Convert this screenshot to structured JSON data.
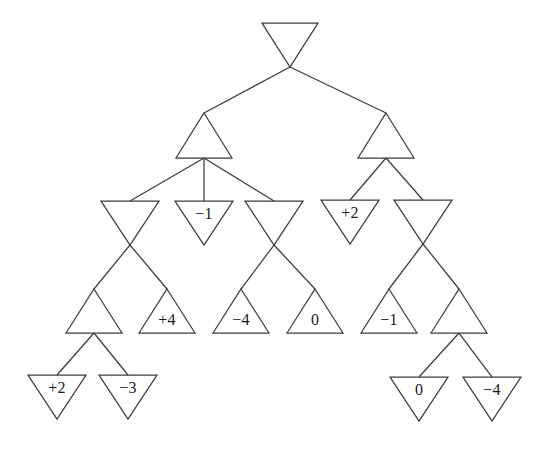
{
  "figure": {
    "kind": "game-tree-diagram",
    "title": "",
    "background_color": "#ffffff",
    "stroke_color": "#3c3c3c",
    "label_color": "#1a1a1a"
  },
  "chart_data": {
    "type": "diagram",
    "title": "",
    "xlabel": "",
    "ylabel": "",
    "node_shapes": {
      "min": "downward-triangle",
      "max": "upward-triangle"
    },
    "levels": [
      {
        "depth": 0,
        "player": "min",
        "shape": "downward-triangle",
        "nodes": [
          {
            "id": "n0",
            "label": "",
            "cx": 290,
            "top_y": 23,
            "apex_y": 67,
            "half_width": 28
          }
        ]
      },
      {
        "depth": 1,
        "player": "max",
        "shape": "upward-triangle",
        "nodes": [
          {
            "id": "n1",
            "label": "",
            "cx": 204,
            "apex_y": 113,
            "base_y": 158,
            "half_width": 28
          },
          {
            "id": "n2",
            "label": "",
            "cx": 386,
            "apex_y": 113,
            "base_y": 158,
            "half_width": 28
          }
        ]
      },
      {
        "depth": 2,
        "player": "min",
        "shape": "downward-triangle",
        "nodes": [
          {
            "id": "n3",
            "label": "",
            "cx": 130,
            "top_y": 201,
            "apex_y": 245,
            "half_width": 29
          },
          {
            "id": "n4",
            "label": "−1",
            "cx": 204,
            "top_y": 201,
            "apex_y": 245,
            "half_width": 29
          },
          {
            "id": "n5",
            "label": "",
            "cx": 274,
            "top_y": 201,
            "apex_y": 245,
            "half_width": 29
          },
          {
            "id": "n6",
            "label": "+2",
            "cx": 350,
            "top_y": 200,
            "apex_y": 244,
            "half_width": 29
          },
          {
            "id": "n7",
            "label": "",
            "cx": 423,
            "top_y": 200,
            "apex_y": 244,
            "half_width": 29
          }
        ]
      },
      {
        "depth": 3,
        "player": "max",
        "shape": "upward-triangle",
        "nodes": [
          {
            "id": "n8",
            "label": "",
            "cx": 94,
            "apex_y": 289,
            "base_y": 333,
            "half_width": 28
          },
          {
            "id": "n9",
            "label": "+4",
            "cx": 167,
            "apex_y": 289,
            "base_y": 333,
            "half_width": 28
          },
          {
            "id": "n10",
            "label": "−4",
            "cx": 241,
            "apex_y": 289,
            "base_y": 333,
            "half_width": 28
          },
          {
            "id": "n11",
            "label": "0",
            "cx": 315,
            "apex_y": 289,
            "base_y": 333,
            "half_width": 28
          },
          {
            "id": "n12",
            "label": "−1",
            "cx": 389,
            "apex_y": 289,
            "base_y": 333,
            "half_width": 28
          },
          {
            "id": "n13",
            "label": "",
            "cx": 459,
            "apex_y": 289,
            "base_y": 333,
            "half_width": 28
          }
        ]
      },
      {
        "depth": 4,
        "player": "min",
        "shape": "downward-triangle",
        "nodes": [
          {
            "id": "n14",
            "label": "+2",
            "cx": 57,
            "top_y": 375,
            "apex_y": 419,
            "half_width": 29
          },
          {
            "id": "n15",
            "label": "−3",
            "cx": 128,
            "top_y": 375,
            "apex_y": 419,
            "half_width": 29
          },
          {
            "id": "n16",
            "label": "0",
            "cx": 419,
            "top_y": 377,
            "apex_y": 421,
            "half_width": 29
          },
          {
            "id": "n17",
            "label": "−4",
            "cx": 492,
            "top_y": 377,
            "apex_y": 421,
            "half_width": 29
          }
        ]
      }
    ],
    "leaf_values": [
      "+2",
      "-3",
      "+4",
      "-4",
      "0",
      "-1",
      "-1",
      "+2",
      "0",
      "-4"
    ],
    "edges": [
      {
        "from": "n0",
        "to": "n1",
        "x1": 290,
        "y1": 67,
        "x2": 204,
        "y2": 113
      },
      {
        "from": "n0",
        "to": "n2",
        "x1": 290,
        "y1": 67,
        "x2": 386,
        "y2": 113
      },
      {
        "from": "n1",
        "to": "n3",
        "x1": 204,
        "y1": 158,
        "x2": 130,
        "y2": 201
      },
      {
        "from": "n1",
        "to": "n4",
        "x1": 204,
        "y1": 158,
        "x2": 204,
        "y2": 201
      },
      {
        "from": "n1",
        "to": "n5",
        "x1": 204,
        "y1": 158,
        "x2": 274,
        "y2": 201
      },
      {
        "from": "n2",
        "to": "n6",
        "x1": 386,
        "y1": 158,
        "x2": 350,
        "y2": 200
      },
      {
        "from": "n2",
        "to": "n7",
        "x1": 386,
        "y1": 158,
        "x2": 423,
        "y2": 200
      },
      {
        "from": "n3",
        "to": "n9",
        "x1": 130,
        "y1": 245,
        "x2": 167,
        "y2": 289
      },
      {
        "from": "n3",
        "to": "n8",
        "x1": 130,
        "y1": 245,
        "x2": 94,
        "y2": 289
      },
      {
        "from": "n5",
        "to": "n11",
        "x1": 274,
        "y1": 245,
        "x2": 315,
        "y2": 289
      },
      {
        "from": "n5",
        "to": "n10",
        "x1": 274,
        "y1": 245,
        "x2": 241,
        "y2": 289
      },
      {
        "from": "n7",
        "to": "n13",
        "x1": 423,
        "y1": 244,
        "x2": 459,
        "y2": 289
      },
      {
        "from": "n7",
        "to": "n12",
        "x1": 423,
        "y1": 244,
        "x2": 389,
        "y2": 289
      },
      {
        "from": "n8",
        "to": "n14",
        "x1": 94,
        "y1": 333,
        "x2": 57,
        "y2": 375
      },
      {
        "from": "n8",
        "to": "n15",
        "x1": 94,
        "y1": 333,
        "x2": 128,
        "y2": 375
      },
      {
        "from": "n13",
        "to": "n16",
        "x1": 459,
        "y1": 333,
        "x2": 419,
        "y2": 377
      },
      {
        "from": "n13",
        "to": "n17",
        "x1": 459,
        "y1": 333,
        "x2": 492,
        "y2": 377
      }
    ]
  }
}
